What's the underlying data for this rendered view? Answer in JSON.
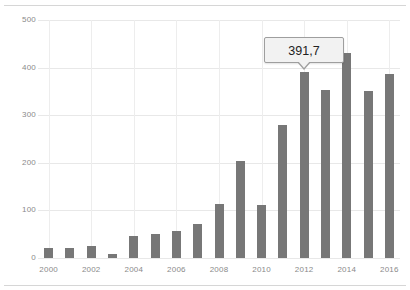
{
  "chart_data": {
    "type": "bar",
    "title": "",
    "subtitle": "",
    "xlabel": "",
    "ylabel": "",
    "categories": [
      "2000",
      "2001",
      "2002",
      "2003",
      "2004",
      "2005",
      "2006",
      "2007",
      "2008",
      "2009",
      "2010",
      "2011",
      "2012",
      "2013",
      "2014",
      "2015",
      "2016"
    ],
    "values": [
      22,
      22,
      25,
      8,
      46,
      50,
      57,
      72,
      114,
      203,
      112,
      280,
      391.7,
      352,
      430,
      350,
      386
    ],
    "series": [
      {
        "name": "",
        "values": [
          22,
          22,
          25,
          8,
          46,
          50,
          57,
          72,
          114,
          203,
          112,
          280,
          391.7,
          352,
          430,
          350,
          386
        ]
      }
    ],
    "ylim": [
      0,
      500
    ],
    "y_ticks": [
      0,
      100,
      200,
      300,
      400,
      500
    ],
    "y_tick_labels": [
      "0",
      "100",
      "200",
      "300",
      "400",
      "500"
    ],
    "x_tick_labels": [
      "2000",
      "2002",
      "2004",
      "2006",
      "2008",
      "2010",
      "2012",
      "2014",
      "2016"
    ],
    "grid": true,
    "legend": false,
    "legend_position": "none",
    "bar_color": "#777777",
    "gridline_color": "#e8e8e8",
    "axis_text_color": "#8a8a8a"
  },
  "tooltip": {
    "value": "391,7",
    "category": "2012",
    "background_color": "#f2f2f2",
    "border_color": "#9e9e9e"
  }
}
